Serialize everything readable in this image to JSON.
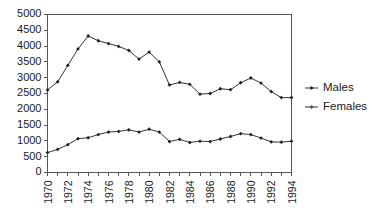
{
  "chart_data": {
    "type": "line",
    "title": "",
    "subtitle": "",
    "xlabel": "",
    "ylabel": "",
    "ylim": [
      0,
      5000
    ],
    "ytick_step": 500,
    "yticks": [
      0,
      500,
      1000,
      1500,
      2000,
      2500,
      3000,
      3500,
      4000,
      4500,
      5000
    ],
    "ytick_labels": [
      "0",
      "500",
      "1000",
      "1500",
      "2000",
      "2500",
      "3000",
      "3500",
      "4000",
      "4500",
      "5000"
    ],
    "x": [
      1970,
      1971,
      1972,
      1973,
      1974,
      1975,
      1976,
      1977,
      1978,
      1979,
      1980,
      1981,
      1982,
      1983,
      1984,
      1985,
      1986,
      1987,
      1988,
      1989,
      1990,
      1991,
      1992,
      1993,
      1994
    ],
    "xtick_labels": [
      "1970",
      "",
      "1972",
      "",
      "1974",
      "",
      "1976",
      "",
      "1978",
      "",
      "1980",
      "",
      "1982",
      "",
      "1984",
      "",
      "1986",
      "",
      "1988",
      "",
      "1990",
      "",
      "1992",
      "",
      "1994"
    ],
    "xtick_labels_shown": [
      "1970",
      "1972",
      "1974",
      "1976",
      "1978",
      "1980",
      "1982",
      "1984",
      "1986",
      "1988",
      "1990",
      "1992",
      "1994"
    ],
    "grid": false,
    "legend_position": "right",
    "series": [
      {
        "name": "Males",
        "color": "#333333",
        "marker": "diamond",
        "values": [
          2610,
          2870,
          3390,
          3910,
          4320,
          4170,
          4080,
          3990,
          3860,
          3590,
          3810,
          3500,
          2770,
          2850,
          2790,
          2480,
          2500,
          2650,
          2620,
          2840,
          2990,
          2830,
          2560,
          2370,
          2370
        ]
      },
      {
        "name": "Females",
        "color": "#555555",
        "marker": "diamond",
        "values": [
          630,
          730,
          880,
          1070,
          1100,
          1200,
          1280,
          1300,
          1350,
          1280,
          1370,
          1280,
          980,
          1050,
          950,
          990,
          980,
          1060,
          1140,
          1230,
          1200,
          1090,
          970,
          960,
          990
        ]
      }
    ]
  },
  "legend": {
    "items": [
      {
        "label": "Males"
      },
      {
        "label": "Females"
      }
    ]
  }
}
